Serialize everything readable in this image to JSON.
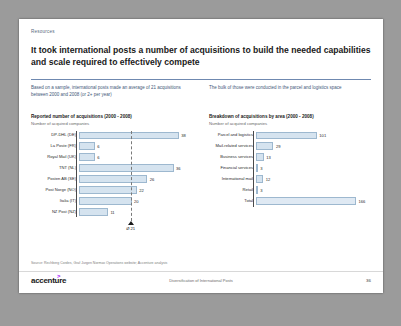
{
  "slide": {
    "kicker": "Resources",
    "headline": "It took international posts a number of acquisitions to build the needed capabilities and scale required to effectively compete",
    "intro_left": "Based on a sample, international posts made an average of 21 acquisitions between 2000 and 2008 (or 2+ per year)",
    "intro_right": "The bulk of those were conducted in the parcel and logistics space",
    "source": "Source:  Rechberg Cordes, Graf Jurgen Normas Operations website; Accenture analysis",
    "logo": "accenture",
    "logo_arrow": ">",
    "footer_title": "Diversification of International Posts",
    "page_number": "36",
    "accent_color": "#6f89b0",
    "bar_fill": "#d5e3ef",
    "bar_stroke": "#9db8cf",
    "brand_color": "#a100ff"
  },
  "chart_data": [
    {
      "type": "bar",
      "orientation": "horizontal",
      "title": "Reported number of acquisitions (2000 - 2008)",
      "subtitle": "Number of acquired companies",
      "xlabel": "",
      "ylabel": "",
      "categories": [
        "DP-DHL (DE)",
        "La Poste (FR)",
        "Royal Mail (UK)",
        "TNT (NL)",
        "Posten AB (SE)",
        "Post Norge (NO)",
        "Italia (IT)",
        "NZ Post (NZ)"
      ],
      "values": [
        38,
        6,
        6,
        36,
        26,
        22,
        20,
        11
      ],
      "value_labels": [
        "38",
        "6",
        "6",
        "36",
        "26",
        "22",
        "20",
        "11"
      ],
      "xlim": [
        0,
        40
      ],
      "grid": false,
      "average": 21,
      "average_label": "Ø 21",
      "legend": ""
    },
    {
      "type": "bar",
      "orientation": "horizontal",
      "title": "Breakdown of acquisitions by area (2000 - 2008)",
      "subtitle": "Number of acquired companies",
      "xlabel": "",
      "ylabel": "",
      "categories": [
        "Parcel and logistics",
        "Mail-related services",
        "Business services",
        "Financial services",
        "International mail",
        "Retail",
        "Total"
      ],
      "values": [
        101,
        29,
        13,
        3,
        12,
        3,
        166
      ],
      "value_labels": [
        "101",
        "29",
        "13",
        "3",
        "12",
        "3",
        "166"
      ],
      "xlim": [
        0,
        166
      ],
      "grid": false,
      "legend": ""
    }
  ]
}
